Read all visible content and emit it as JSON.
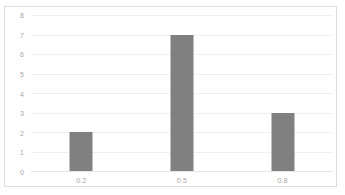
{
  "chart_data": {
    "type": "bar",
    "title": "",
    "subtitle": "",
    "xlabel": "",
    "ylabel": "",
    "categories": [
      "0.2",
      "0.5",
      "0.8"
    ],
    "values": [
      2,
      7,
      3
    ],
    "series": [
      {
        "name": "",
        "values": [
          2,
          7,
          3
        ]
      }
    ],
    "ylim": [
      0,
      8
    ],
    "yticks": [
      "0",
      "1",
      "2",
      "3",
      "4",
      "5",
      "6",
      "7",
      "8"
    ],
    "ytick_values": [
      0,
      1,
      2,
      3,
      4,
      5,
      6,
      7,
      8
    ],
    "grid": "horizontal",
    "legend": "none",
    "colors": {
      "bar": "#808080",
      "gridline": "#f0f0f0",
      "baseline": "#e6e6e6",
      "axis_text": "#a6a6a6",
      "frame_border": "#dcdcdc",
      "background": "#ffffff"
    }
  }
}
